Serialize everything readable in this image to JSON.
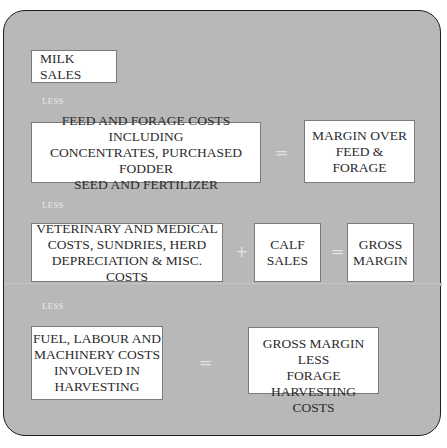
{
  "diagram": {
    "title": "",
    "background_color": "#b8b8b8",
    "box_color": "#ffffff",
    "rows": [
      {
        "boxes": [
          {
            "label": "MILK SALES"
          }
        ]
      },
      {
        "connector": "LESS",
        "boxes": [
          {
            "label": "FEED AND FORAGE COSTS INCLUDING\nCONCENTRATES, PURCHASED FODDER\nSEED AND FERTILIZER"
          },
          {
            "label": "MARGIN OVER\nFEED &\nFORAGE"
          }
        ],
        "operators": [
          "="
        ]
      },
      {
        "connector": "LESS",
        "boxes": [
          {
            "label": "VETERINARY AND MEDICAL\nCOSTS, SUNDRIES, HERD\nDEPRECIATION & MISC. COSTS"
          },
          {
            "label": "CALF\nSALES"
          },
          {
            "label": "GROSS\nMARGIN"
          }
        ],
        "operators": [
          "+",
          "="
        ]
      },
      {
        "connector": "LESS",
        "boxes": [
          {
            "label": "FUEL, LABOUR AND\nMACHINERY COSTS\nINVOLVED IN\nHARVESTING"
          },
          {
            "label": "GROSS MARGIN LESS\nFORAGE HARVESTING\nCOSTS"
          }
        ],
        "operators": [
          "="
        ]
      }
    ]
  }
}
